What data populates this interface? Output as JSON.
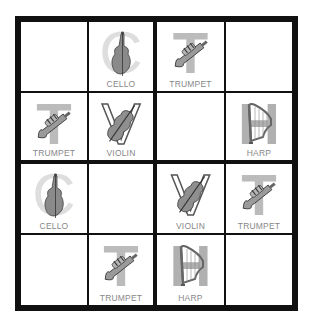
{
  "puzzle": {
    "type": "4x4 picture sudoku",
    "grid_size": 4,
    "symbols": [
      "CELLO",
      "TRUMPET",
      "VIOLIN",
      "HARP"
    ],
    "rows": [
      [
        {
          "label": "",
          "letter": "",
          "icon": ""
        },
        {
          "label": "CELLO",
          "letter": "C",
          "icon": "cello-icon"
        },
        {
          "label": "TRUMPET",
          "letter": "T",
          "icon": "trumpet-icon"
        },
        {
          "label": "",
          "letter": "",
          "icon": ""
        }
      ],
      [
        {
          "label": "TRUMPET",
          "letter": "T",
          "icon": "trumpet-icon"
        },
        {
          "label": "VIOLIN",
          "letter": "V",
          "icon": "violin-icon"
        },
        {
          "label": "",
          "letter": "",
          "icon": ""
        },
        {
          "label": "HARP",
          "letter": "H",
          "icon": "harp-icon"
        }
      ],
      [
        {
          "label": "CELLO",
          "letter": "C",
          "icon": "cello-icon"
        },
        {
          "label": "",
          "letter": "",
          "icon": ""
        },
        {
          "label": "VIOLIN",
          "letter": "V",
          "icon": "violin-icon"
        },
        {
          "label": "TRUMPET",
          "letter": "T",
          "icon": "trumpet-icon"
        }
      ],
      [
        {
          "label": "",
          "letter": "",
          "icon": ""
        },
        {
          "label": "TRUMPET",
          "letter": "T",
          "icon": "trumpet-icon"
        },
        {
          "label": "HARP",
          "letter": "H",
          "icon": "harp-icon"
        },
        {
          "label": "",
          "letter": "",
          "icon": ""
        }
      ]
    ]
  },
  "colors": {
    "grid_line": "#111111",
    "letter_gray": "#bdbdbd",
    "label_gray": "#888888",
    "background": "#ffffff"
  }
}
